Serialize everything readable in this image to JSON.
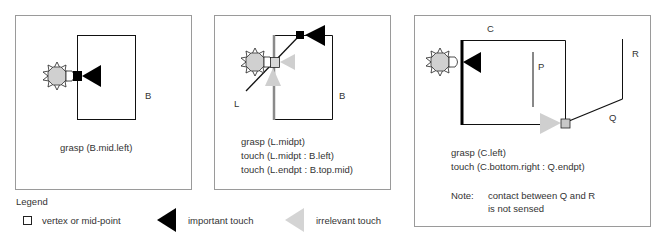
{
  "colors": {
    "frame": "#9a9a9a",
    "line": "#111111",
    "important": "#000000",
    "irrelevant": "#cfcfcf",
    "gripper_fill": "#d0d0d0",
    "vertex_gray": "#c8c8c8",
    "text": "#333333"
  },
  "panels": [
    {
      "id": "panel-1",
      "object_label": "B",
      "caption": [
        "grasp (B.mid.left)"
      ]
    },
    {
      "id": "panel-2",
      "object_label": "B",
      "line_label": "L",
      "caption": [
        "grasp (L.midpt)",
        "touch (L.midpt : B.left)",
        "touch (L.endpt : B.top.mid)"
      ]
    },
    {
      "id": "panel-3",
      "labels": {
        "c": "C",
        "p": "P",
        "r": "R",
        "q": "Q"
      },
      "caption": [
        "grasp (C.left)",
        "touch (C.bottom.right : Q.endpt)"
      ],
      "note_label": "Note:",
      "note_lines": [
        "contact between Q and R",
        "is not sensed"
      ]
    }
  ],
  "legend": {
    "title": "Legend",
    "items": [
      {
        "icon": "vertex-square-icon",
        "label": "vertex or mid-point"
      },
      {
        "icon": "important-touch-triangle-icon",
        "label": "important touch"
      },
      {
        "icon": "irrelevant-touch-triangle-icon",
        "label": "irrelevant touch"
      }
    ]
  }
}
